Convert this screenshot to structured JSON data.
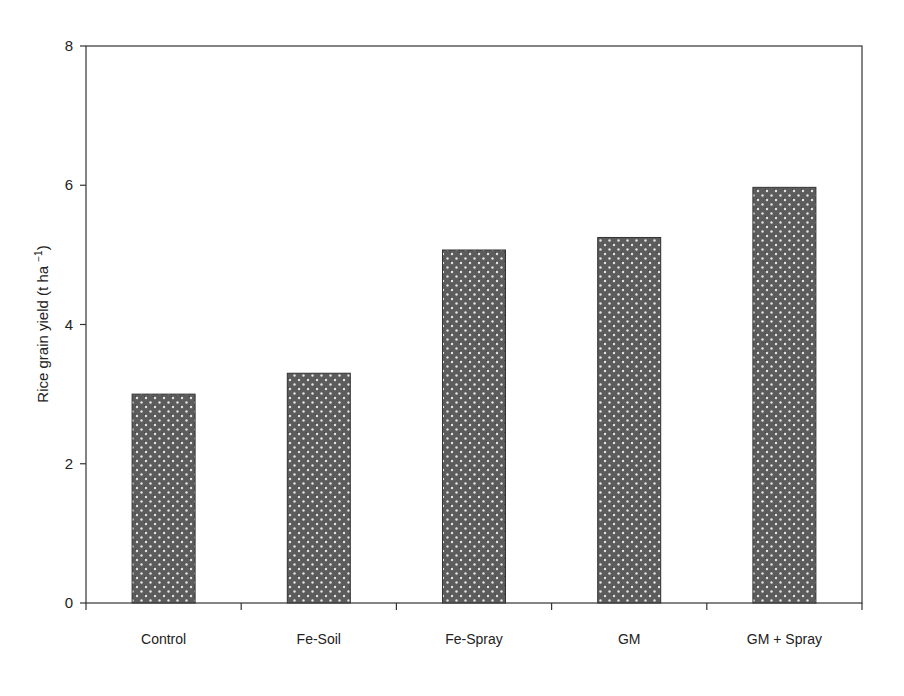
{
  "chart_data": {
    "type": "bar",
    "title": "",
    "xlabel": "",
    "ylabel": "Rice grain yield (t ha⁻¹)",
    "ylabel_main": "Rice grain yield (t ha",
    "ylabel_sup": "−1",
    "ylabel_close": ")",
    "categories": [
      "Control",
      "Fe-Soil",
      "Fe-Spray",
      "GM",
      "GM + Spray"
    ],
    "values": [
      3.0,
      3.3,
      5.07,
      5.25,
      5.97
    ],
    "ylim": [
      0,
      8
    ],
    "yticks": [
      0,
      2,
      4,
      6,
      8
    ],
    "grid": false,
    "legend": null,
    "bar_fill": "#5a5a5a",
    "bar_dot": "#e8e8e8"
  }
}
